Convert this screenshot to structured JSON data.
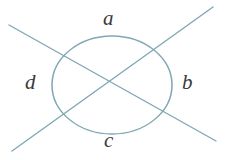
{
  "figure": {
    "colors": {
      "stroke": "#7fa8b5",
      "label_text": "#3a3a3c",
      "background": "#ffffff"
    },
    "geometry": {
      "intersection": {
        "x": 113,
        "y": 86
      },
      "line_1": {
        "x1": 9,
        "y1": 25,
        "x2": 216,
        "y2": 141
      },
      "line_2": {
        "x1": 12,
        "y1": 151,
        "x2": 213,
        "y2": 7
      },
      "circle": {
        "cx": 112,
        "cy": 85,
        "rx": 60,
        "ry": 49
      },
      "stroke_width": 1.4
    },
    "labels": {
      "top": "a",
      "right": "b",
      "bottom": "c",
      "left": "d"
    }
  }
}
